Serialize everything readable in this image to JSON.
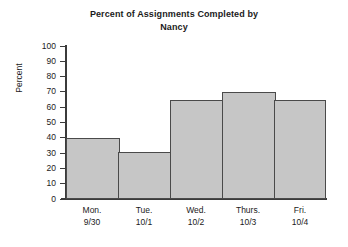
{
  "chart_data": {
    "type": "bar",
    "title": "Percent of Assignments Completed by Nancy",
    "title_lines": [
      "Percent of Assignments Completed by",
      "Nancy"
    ],
    "categories": [
      "Mon.",
      "Tue.",
      "Wed.",
      "Thurs.",
      "Fri."
    ],
    "category_sublabels": [
      "9/30",
      "10/1",
      "10/2",
      "10/3",
      "10/4"
    ],
    "values": [
      40,
      31,
      65,
      70,
      65
    ],
    "xlabel": "",
    "ylabel": "Percent",
    "ylim": [
      0,
      100
    ],
    "ytick_step": 10,
    "yticks": [
      0,
      10,
      20,
      30,
      40,
      50,
      60,
      70,
      80,
      90,
      100
    ],
    "ytick_labels": [
      "0",
      "10",
      "20",
      "30",
      "40",
      "50",
      "60",
      "70",
      "80",
      "90",
      "100"
    ],
    "grid": false,
    "legend": false,
    "legend_position": "none",
    "bar_gap": 0,
    "colors": {
      "bar_fill": "#c6c6c6",
      "bar_border": "#4a4a4a",
      "axis": "#3b3b3b",
      "text": "#1b1b1b",
      "background": "#ffffff"
    }
  }
}
